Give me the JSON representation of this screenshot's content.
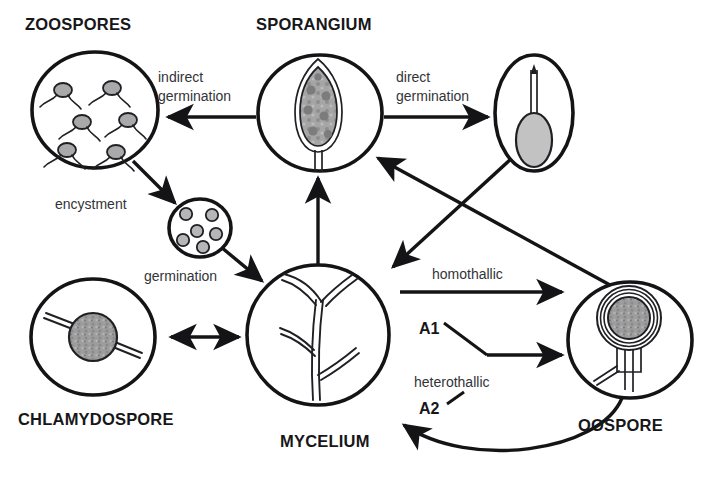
{
  "diagram": {
    "title_text": "",
    "background_color": "#ffffff",
    "line_color": "#141417",
    "fill_gray": "#a8a8a8",
    "stages": [
      {
        "id": "zoospores",
        "label": "ZOOSPORES",
        "label_x": 25,
        "label_y": 30,
        "shape": "ellipse",
        "cx": 95,
        "cy": 110,
        "rx": 63,
        "ry": 58,
        "contents": "six biflagellate zoospores"
      },
      {
        "id": "cyst",
        "label": "",
        "label_x": 0,
        "label_y": 0,
        "shape": "ellipse",
        "cx": 200,
        "cy": 228,
        "rx": 31,
        "ry": 29,
        "contents": "six encysted spores"
      },
      {
        "id": "chlamydospore",
        "label": "CHLAMYDOSPORE",
        "label_x": 18,
        "label_y": 425,
        "shape": "ellipse",
        "cx": 93,
        "cy": 337,
        "rx": 62,
        "ry": 58,
        "contents": "thick-walled gray spore on hypha"
      },
      {
        "id": "sporangium",
        "label": "SPORANGIUM",
        "label_x": 256,
        "label_y": 30,
        "shape": "ellipse",
        "cx": 320,
        "cy": 113,
        "rx": 62,
        "ry": 58,
        "contents": "lemon-shaped sporangium with papilla and stalk"
      },
      {
        "id": "germinated-cyst",
        "label": "",
        "label_x": 0,
        "label_y": 0,
        "shape": "ellipse",
        "cx": 534,
        "cy": 113,
        "rx": 39,
        "ry": 58,
        "contents": "cyst with long germ tube"
      },
      {
        "id": "mycelium",
        "label": "MYCELIUM",
        "label_x": 280,
        "label_y": 447,
        "shape": "ellipse",
        "cx": 318,
        "cy": 335,
        "rx": 71,
        "ry": 70,
        "contents": "branching hyphae"
      },
      {
        "id": "oospore",
        "label": "OOSPORE",
        "label_x": 578,
        "label_y": 431,
        "shape": "ellipse",
        "cx": 630,
        "cy": 340,
        "rx": 62,
        "ry": 58,
        "contents": "thick-walled oospore within oogonium with antheridium"
      }
    ],
    "processes": [
      {
        "id": "indirect-germination",
        "lines": [
          "indirect",
          "germination"
        ],
        "x": 158,
        "y": 82,
        "from": "sporangium",
        "to": "zoospores"
      },
      {
        "id": "direct-germination",
        "lines": [
          "direct",
          "germination"
        ],
        "x": 396,
        "y": 82,
        "from": "sporangium",
        "to": "germinated-cyst"
      },
      {
        "id": "encystment",
        "lines": [
          "encystment"
        ],
        "x": 55,
        "y": 209,
        "from": "zoospores",
        "to": "cyst"
      },
      {
        "id": "germination",
        "lines": [
          "germination"
        ],
        "x": 144,
        "y": 281,
        "from": "cyst",
        "to": "mycelium"
      },
      {
        "id": "homothallic",
        "lines": [
          "homothallic"
        ],
        "x": 432,
        "y": 279,
        "from": "mycelium",
        "to": "oospore"
      },
      {
        "id": "heterothallic",
        "lines": [
          "heterothallic"
        ],
        "x": 414,
        "y": 387,
        "from": "mycelium",
        "to": "oospore"
      }
    ],
    "mating_types": [
      {
        "id": "a1",
        "label": "A1",
        "x": 419,
        "y": 334
      },
      {
        "id": "a2",
        "label": "A2",
        "x": 419,
        "y": 414
      }
    ]
  }
}
